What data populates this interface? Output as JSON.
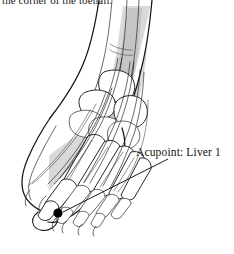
{
  "figure": {
    "background_color": "#ffffff",
    "ink_color": "#1a1a1a",
    "shade_color": "#cfcfcf"
  },
  "caption": {
    "text": "the corner of the toenail.",
    "note": "clipped at top edge of image"
  },
  "annotation": {
    "label": "Acupoint: Liver 1",
    "marker": {
      "name": "acupoint-dot",
      "color": "#000000",
      "x": 58,
      "y": 213,
      "radius": 4.5
    },
    "leader_line": {
      "color": "#1a1a1a",
      "from_x": 168,
      "from_y": 159,
      "to_x": 63,
      "to_y": 212
    }
  },
  "anatomy": {
    "view": "dorsal oblique right foot",
    "structures": [
      "tibia",
      "fibula",
      "talus",
      "navicular",
      "cuneiforms",
      "metatarsals",
      "proximal phalanges",
      "distal phalanges",
      "extensor digitorum longus tendons",
      "extensor hallucis longus tendon"
    ]
  }
}
